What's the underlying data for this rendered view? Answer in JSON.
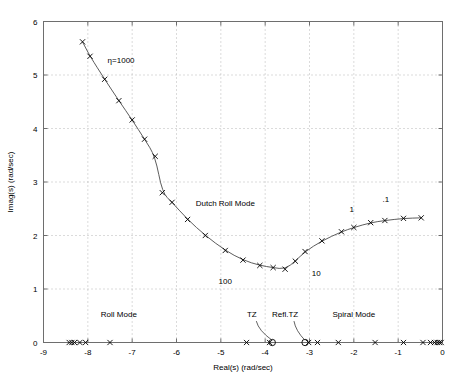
{
  "chart_data": {
    "type": "line",
    "title": "",
    "subtitle": "",
    "xlabel": "Real(s) (rad/sec)",
    "ylabel": "Imag(s) (rad/sec)",
    "xlim": [
      -9,
      0
    ],
    "ylim": [
      0,
      6
    ],
    "xticks": [
      -9,
      -8,
      -7,
      -6,
      -5,
      -4,
      -3,
      -2,
      -1,
      0
    ],
    "xticklabels": [
      "-9",
      "-8",
      "-7",
      "-6",
      "-5",
      "-4",
      "-3",
      "-2",
      "-1",
      "0"
    ],
    "yticks": [
      0,
      1,
      2,
      3,
      4,
      5,
      6
    ],
    "yticklabels": [
      "0",
      "1",
      "2",
      "3",
      "4",
      "5",
      "6"
    ],
    "grid": true,
    "grid_style": "dotted",
    "legend": "none",
    "line_color": "#4a4a4a",
    "marker_color": "#000000",
    "series": [
      {
        "name": "Dutch Roll Mode locus (upper branch)",
        "marker": "x",
        "points": [
          [
            -8.12,
            5.62
          ],
          [
            -7.95,
            5.35
          ],
          [
            -7.62,
            4.92
          ],
          [
            -7.3,
            4.52
          ],
          [
            -7.0,
            4.16
          ],
          [
            -6.72,
            3.8
          ],
          [
            -6.48,
            3.48
          ],
          [
            -6.32,
            2.8
          ],
          [
            -6.1,
            2.62
          ],
          [
            -5.75,
            2.3
          ],
          [
            -5.35,
            2.0
          ],
          [
            -4.9,
            1.72
          ],
          [
            -4.5,
            1.54
          ],
          [
            -4.12,
            1.44
          ],
          [
            -3.82,
            1.4
          ],
          [
            -3.55,
            1.37
          ],
          [
            -3.32,
            1.52
          ],
          [
            -3.1,
            1.7
          ],
          [
            -2.72,
            1.9
          ],
          [
            -2.28,
            2.07
          ],
          [
            -2.0,
            2.15
          ],
          [
            -1.62,
            2.24
          ],
          [
            -1.3,
            2.28
          ],
          [
            -0.88,
            2.32
          ],
          [
            -0.48,
            2.33
          ]
        ]
      },
      {
        "name": "Real-axis poles (x markers)",
        "marker": "x",
        "points": [
          [
            -8.42,
            0
          ],
          [
            -8.36,
            0
          ],
          [
            -8.3,
            0
          ],
          [
            -8.18,
            0
          ],
          [
            -8.05,
            0
          ],
          [
            -7.5,
            0
          ],
          [
            -4.42,
            0
          ],
          [
            -3.9,
            0
          ],
          [
            -3.02,
            0
          ],
          [
            -2.82,
            0
          ],
          [
            -2.35,
            0
          ],
          [
            -1.52,
            0
          ],
          [
            -0.88,
            0
          ],
          [
            -0.44,
            0
          ],
          [
            -0.27,
            0
          ],
          [
            -0.18,
            0
          ],
          [
            -0.12,
            0
          ],
          [
            -0.07,
            0
          ],
          [
            -0.03,
            0
          ]
        ]
      },
      {
        "name": "Transmission zeros (o markers)",
        "marker": "o",
        "points": [
          [
            -3.84,
            0
          ],
          [
            -3.1,
            0
          ]
        ]
      }
    ],
    "annotations": [
      {
        "text": "η=1000",
        "x": -7.25,
        "y": 5.22,
        "name": "eta-1000-label"
      },
      {
        "text": "Dutch Roll Mode",
        "x": -4.9,
        "y": 2.55,
        "name": "dutch-roll-mode-label"
      },
      {
        "text": "100",
        "x": -4.9,
        "y": 1.1,
        "name": "gain-100-label"
      },
      {
        "text": "10",
        "x": -2.85,
        "y": 1.25,
        "name": "gain-10-label"
      },
      {
        "text": "1",
        "x": -2.05,
        "y": 2.43,
        "name": "gain-1-label"
      },
      {
        "text": ".1",
        "x": -1.28,
        "y": 2.62,
        "name": "gain-point1-label"
      },
      {
        "text": "Roll Mode",
        "x": -7.3,
        "y": 0.48,
        "name": "roll-mode-label"
      },
      {
        "text": "TZ",
        "x": -4.3,
        "y": 0.48,
        "name": "tz-label"
      },
      {
        "text": "Refl.TZ",
        "x": -3.55,
        "y": 0.48,
        "name": "refl-tz-label"
      },
      {
        "text": "Spiral Mode",
        "x": -2.0,
        "y": 0.48,
        "name": "spiral-mode-label"
      }
    ],
    "leaders": [
      {
        "name": "tz-leader-line",
        "from": [
          -4.2,
          0.4
        ],
        "to": [
          -3.84,
          0.04
        ]
      },
      {
        "name": "refl-tz-leader-line",
        "from": [
          -3.35,
          0.4
        ],
        "to": [
          -3.1,
          0.04
        ]
      }
    ]
  }
}
